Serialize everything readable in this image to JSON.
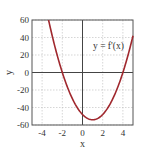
{
  "chart_data": {
    "type": "line",
    "title": "",
    "xlabel": "x",
    "ylabel": "y",
    "xlim": [
      -5,
      5
    ],
    "ylim": [
      -60,
      60
    ],
    "xticks": [
      -4,
      -2,
      0,
      2,
      4
    ],
    "xtick_labels": [
      "-4",
      "-2",
      "0",
      "2",
      "4"
    ],
    "yticks": [
      -60,
      -40,
      -20,
      0,
      20,
      40,
      60
    ],
    "ytick_labels": [
      "-60",
      "-40",
      "-20",
      "0",
      "20",
      "40",
      "60"
    ],
    "grid": true,
    "annotation": "y = f'(x)",
    "series": [
      {
        "name": "y = f'(x)",
        "color": "#a0282e",
        "x": [
          -3.36,
          -3,
          -2.5,
          -2,
          -1.5,
          -1,
          -0.5,
          0,
          0.5,
          1,
          1.5,
          2,
          2.5,
          3,
          3.5,
          4,
          4.5,
          5
        ],
        "y": [
          60,
          42,
          19.5,
          0,
          -16.5,
          -30,
          -40.5,
          -48,
          -52.5,
          -54,
          -52.5,
          -48,
          -40.5,
          -30,
          -16.5,
          0,
          19.5,
          42
        ]
      }
    ]
  }
}
